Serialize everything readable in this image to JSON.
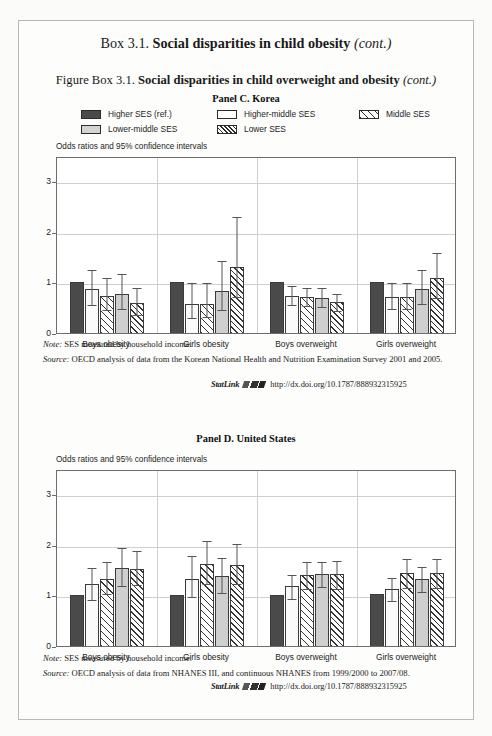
{
  "box": {
    "label": "Box 3.1.",
    "title": "Social disparities in child obesity",
    "cont": "(cont.)"
  },
  "figure": {
    "label": "Figure Box 3.1.",
    "title": "Social disparities in child overweight and obesity",
    "cont": "(cont.)"
  },
  "legend": {
    "items": [
      {
        "label": "Higher SES (ref.)",
        "pattern": "solid-dark"
      },
      {
        "label": "Higher-middle SES",
        "pattern": "solid-white"
      },
      {
        "label": "Middle SES",
        "pattern": "hatch-sparse"
      },
      {
        "label": "Lower-middle SES",
        "pattern": "solid-lightgray"
      },
      {
        "label": "Lower SES",
        "pattern": "hatch-dense"
      }
    ]
  },
  "panels": [
    {
      "id": "panel-c",
      "title": "Panel C. Korea",
      "axis_caption": "Odds ratios and 95% confidence intervals",
      "note_label": "Note:",
      "note_text": "SES measured by household income.",
      "source_label": "Source:",
      "source_text": "OECD analysis of data from the Korean National Health and Nutrition Examination Survey 2001 and 2005.",
      "statlink_label": "StatLink",
      "statlink_url": "http://dx.doi.org/10.1787/888932315925"
    },
    {
      "id": "panel-d",
      "title": "Panel D. United States",
      "axis_caption": "Odds ratios and 95% confidence intervals",
      "note_label": "Note:",
      "note_text": "SES measured by household income.",
      "source_label": "Source:",
      "source_text": "OECD analysis of data from NHANES III, and continuous NHANES from 1999/2000 to 2007/08.",
      "statlink_label": "StatLink",
      "statlink_url": "http://dx.doi.org/10.1787/888932315925"
    }
  ],
  "chart_data": [
    {
      "type": "bar",
      "title": "Panel C. Korea",
      "xlabel": "",
      "ylabel": "Odds ratios and 95% confidence intervals",
      "ylim": [
        0,
        3.5
      ],
      "yticks": [
        0,
        1,
        2,
        3
      ],
      "grid": true,
      "legend_position": "top",
      "categories": [
        "Boys obesity",
        "Girls obesity",
        "Boys overweight",
        "Girls overweight"
      ],
      "series": [
        {
          "name": "Higher SES (ref.)",
          "values": [
            1.0,
            1.0,
            1.0,
            1.0
          ],
          "ci_low": [
            null,
            null,
            null,
            null
          ],
          "ci_high": [
            null,
            null,
            null,
            null
          ]
        },
        {
          "name": "Higher-middle SES",
          "values": [
            0.87,
            0.57,
            0.74,
            0.72
          ],
          "ci_low": [
            0.58,
            0.32,
            0.57,
            0.5
          ],
          "ci_high": [
            1.28,
            1.02,
            0.96,
            1.02
          ]
        },
        {
          "name": "Middle SES",
          "values": [
            0.74,
            0.57,
            0.71,
            0.72
          ],
          "ci_low": [
            0.48,
            0.33,
            0.55,
            0.5
          ],
          "ci_high": [
            1.13,
            1.03,
            0.93,
            1.02
          ]
        },
        {
          "name": "Lower-middle SES",
          "values": [
            0.78,
            0.83,
            0.7,
            0.87
          ],
          "ci_low": [
            0.5,
            0.48,
            0.53,
            0.6
          ],
          "ci_high": [
            1.2,
            1.46,
            0.93,
            1.28
          ]
        },
        {
          "name": "Lower SES",
          "values": [
            0.6,
            1.3,
            0.61,
            1.08
          ],
          "ci_low": [
            0.38,
            0.73,
            0.46,
            0.72
          ],
          "ci_high": [
            0.93,
            2.33,
            0.81,
            1.62
          ]
        }
      ]
    },
    {
      "type": "bar",
      "title": "Panel D. United States",
      "xlabel": "",
      "ylabel": "Odds ratios and 95% confidence intervals",
      "ylim": [
        0,
        3.5
      ],
      "yticks": [
        0,
        1,
        2,
        3
      ],
      "grid": true,
      "legend_position": "top",
      "categories": [
        "Boys obesity",
        "Girls obesity",
        "Boys overweight",
        "Girls overweight"
      ],
      "series": [
        {
          "name": "Higher SES (ref.)",
          "values": [
            1.0,
            1.0,
            1.01,
            1.02
          ],
          "ci_low": [
            null,
            null,
            null,
            null
          ],
          "ci_high": [
            null,
            null,
            null,
            null
          ]
        },
        {
          "name": "Higher-middle SES",
          "values": [
            1.22,
            1.33,
            1.18,
            1.13
          ],
          "ci_low": [
            0.93,
            0.98,
            0.95,
            0.91
          ],
          "ci_high": [
            1.59,
            1.81,
            1.45,
            1.38
          ]
        },
        {
          "name": "Middle SES",
          "values": [
            1.33,
            1.62,
            1.4,
            1.44
          ],
          "ci_low": [
            1.04,
            1.25,
            1.15,
            1.17
          ],
          "ci_high": [
            1.7,
            2.12,
            1.7,
            1.76
          ]
        },
        {
          "name": "Lower-middle SES",
          "values": [
            1.55,
            1.38,
            1.43,
            1.32
          ],
          "ci_low": [
            1.21,
            1.07,
            1.19,
            1.08
          ],
          "ci_high": [
            1.98,
            1.78,
            1.7,
            1.6
          ]
        },
        {
          "name": "Lower SES",
          "values": [
            1.53,
            1.6,
            1.42,
            1.45
          ],
          "ci_low": [
            1.22,
            1.24,
            1.15,
            1.17
          ],
          "ci_high": [
            1.92,
            2.06,
            1.73,
            1.76
          ]
        }
      ]
    }
  ]
}
